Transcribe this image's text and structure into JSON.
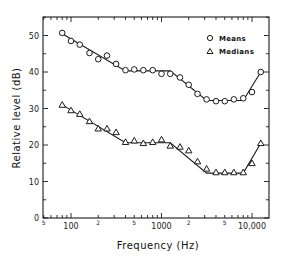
{
  "chart_data": {
    "type": "line",
    "title": "",
    "xlabel": "Frequency (Hz)",
    "ylabel": "Relative level (dB)",
    "xscale": "log",
    "xlim": [
      50,
      15500
    ],
    "ylim": [
      0,
      55
    ],
    "grid": false,
    "legend_position": "upper right",
    "x_major_ticks": [
      100,
      1000,
      10000
    ],
    "x_major_tick_labels": [
      "100",
      "1000",
      "10,000"
    ],
    "x_minor_tick_labels": [
      {
        "value": 50,
        "label": "5"
      },
      {
        "value": 200,
        "label": "2"
      },
      {
        "value": 500,
        "label": "5"
      },
      {
        "value": 2000,
        "label": "2"
      },
      {
        "value": 5000,
        "label": "5"
      }
    ],
    "y_ticks": [
      0,
      10,
      20,
      30,
      40,
      50
    ],
    "y_tick_labels": [
      "0",
      "10",
      "20",
      "30",
      "40",
      "50"
    ],
    "x": [
      80,
      100,
      125,
      160,
      200,
      250,
      315,
      400,
      500,
      630,
      800,
      1000,
      1250,
      1600,
      2000,
      2500,
      3150,
      4000,
      5000,
      6300,
      8000,
      10000,
      12500
    ],
    "series": [
      {
        "name": "Means",
        "marker": "circle",
        "values": [
          50.7,
          48.5,
          47.5,
          45.2,
          43.5,
          44.5,
          42.2,
          40.5,
          40.7,
          40.5,
          40.5,
          39.5,
          39.5,
          38.5,
          36.5,
          34.0,
          32.5,
          32.0,
          32.0,
          32.5,
          32.8,
          34.5,
          40.0
        ],
        "fit_line": {
          "x": [
            80,
            400,
            1250,
            3150,
            8000,
            12500
          ],
          "y": [
            50.5,
            40.3,
            40.3,
            32.2,
            32.2,
            40.0
          ]
        }
      },
      {
        "name": "Medians",
        "marker": "triangle",
        "values": [
          31.0,
          29.5,
          28.5,
          26.5,
          24.5,
          24.5,
          23.5,
          20.8,
          21.2,
          20.5,
          20.8,
          21.5,
          19.8,
          19.5,
          18.5,
          15.5,
          13.5,
          12.5,
          12.5,
          12.5,
          12.5,
          15.0,
          20.5
        ],
        "fit_line": {
          "x": [
            80,
            400,
            1250,
            3150,
            8000,
            12500
          ],
          "y": [
            31.0,
            20.6,
            20.6,
            12.3,
            12.3,
            20.5
          ]
        }
      }
    ]
  },
  "legend": {
    "means_label": "Means",
    "medians_label": "Medians"
  },
  "axes": {
    "xlabel": "Frequency (Hz)",
    "ylabel": "Relative level (dB)"
  },
  "colors": {
    "ink": "#1a1a1a",
    "background": "#ffffff"
  }
}
